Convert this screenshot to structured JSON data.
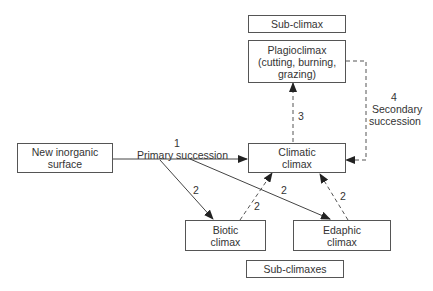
{
  "diagram": {
    "type": "flowchart",
    "nodes": {
      "sub_climax_header": {
        "label": "Sub-climax"
      },
      "plagioclimax": {
        "line1": "Plagioclimax",
        "line2": "(cutting, burning,",
        "line3": "grazing)"
      },
      "new_surface": {
        "line1": "New inorganic",
        "line2": "surface"
      },
      "climatic": {
        "line1": "Climatic",
        "line2": "climax"
      },
      "biotic": {
        "line1": "Biotic",
        "line2": "climax"
      },
      "edaphic": {
        "line1": "Edaphic",
        "line2": "climax"
      },
      "sub_climaxes_footer": {
        "label": "Sub-climaxes"
      }
    },
    "edge_labels": {
      "primary_num": "1",
      "primary_text": "Primary succession",
      "to_biotic": "2",
      "to_edaphic": "2",
      "biotic_to_climatic": "2",
      "edaphic_to_climatic": "2",
      "climatic_to_plagio": "3",
      "secondary_num": "4",
      "secondary_line1": "Secondary",
      "secondary_line2": "succession"
    },
    "edges": [
      {
        "from": "new_surface",
        "to": "climatic",
        "style": "solid",
        "label": "1 Primary succession"
      },
      {
        "from": "new_surface",
        "to": "biotic",
        "style": "solid",
        "label": "2"
      },
      {
        "from": "new_surface",
        "to": "edaphic",
        "style": "solid",
        "label": "2"
      },
      {
        "from": "biotic",
        "to": "climatic",
        "style": "dashed",
        "label": "2"
      },
      {
        "from": "edaphic",
        "to": "climatic",
        "style": "dashed",
        "label": "2"
      },
      {
        "from": "climatic",
        "to": "plagioclimax",
        "style": "dashed",
        "label": "3"
      },
      {
        "from": "plagioclimax",
        "to": "climatic",
        "style": "dashed",
        "label": "4 Secondary succession"
      }
    ]
  }
}
